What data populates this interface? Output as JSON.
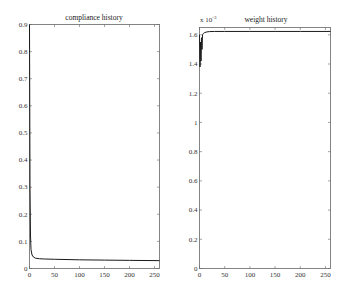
{
  "chart_data": [
    {
      "type": "line",
      "title": "compliance history",
      "xlabel": "",
      "ylabel": "",
      "xlim": [
        0,
        260
      ],
      "ylim": [
        0,
        0.9
      ],
      "xticks": [
        "0",
        "50",
        "100",
        "150",
        "200",
        "250"
      ],
      "yticks": [
        "0",
        "0.1",
        "0.2",
        "0.3",
        "0.4",
        "0.5",
        "0.6",
        "0.7",
        "0.8",
        "0.9"
      ],
      "grid": false,
      "series": [
        {
          "name": "compliance",
          "x": [
            0,
            1,
            2,
            3,
            5,
            8,
            12,
            20,
            30,
            50,
            100,
            150,
            200,
            260
          ],
          "y": [
            0.9,
            0.3,
            0.12,
            0.07,
            0.05,
            0.042,
            0.038,
            0.036,
            0.035,
            0.034,
            0.032,
            0.031,
            0.03,
            0.029
          ]
        }
      ]
    },
    {
      "type": "line",
      "title": "weight history",
      "xlabel": "",
      "ylabel": "",
      "multiplier": "x 10^-3",
      "xlim": [
        0,
        260
      ],
      "ylim": [
        0,
        1.65
      ],
      "xticks": [
        "0",
        "50",
        "100",
        "150",
        "200",
        "250"
      ],
      "yticks": [
        "0",
        "0.2",
        "0.4",
        "0.6",
        "0.8",
        "1",
        "1.2",
        "1.4",
        "1.6"
      ],
      "grid": false,
      "series": [
        {
          "name": "weight",
          "x": [
            0,
            1,
            2,
            3,
            4,
            5,
            6,
            8,
            10,
            15,
            20,
            30,
            50,
            100,
            150,
            200,
            260
          ],
          "y": [
            1.6,
            1.38,
            1.55,
            1.42,
            1.58,
            1.5,
            1.6,
            1.61,
            1.615,
            1.62,
            1.622,
            1.623,
            1.623,
            1.623,
            1.623,
            1.623,
            1.623
          ]
        }
      ]
    }
  ],
  "left": {
    "title": "compliance history",
    "yticks": [
      "0",
      "0.1",
      "0.2",
      "0.3",
      "0.4",
      "0.5",
      "0.6",
      "0.7",
      "0.8",
      "0.9"
    ],
    "xticks": [
      "0",
      "50",
      "100",
      "150",
      "200",
      "250"
    ]
  },
  "right": {
    "title": "weight history",
    "multiplier": "x 10",
    "exponent": "-3",
    "yticks": [
      "0",
      "0.2",
      "0.4",
      "0.6",
      "0.8",
      "1",
      "1.2",
      "1.4",
      "1.6"
    ],
    "xticks": [
      "0",
      "50",
      "100",
      "150",
      "200",
      "250"
    ]
  },
  "colors": {
    "line": "#1a1a1a",
    "axis": "#555555"
  }
}
